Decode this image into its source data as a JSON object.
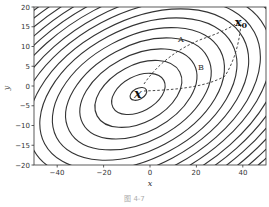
{
  "chart_data": {
    "type": "contour",
    "title": "",
    "xlabel": "x",
    "ylabel": "y",
    "xlim": [
      -50,
      50
    ],
    "ylim": [
      -20,
      20
    ],
    "xticks": [
      -40,
      -20,
      0,
      20,
      40
    ],
    "yticks": [
      -20,
      -15,
      -10,
      -5,
      0,
      5,
      10,
      15,
      20
    ],
    "grid": false,
    "minimum": {
      "label": "x",
      "x": -5,
      "y": -2
    },
    "start_point": {
      "label": "x0",
      "x": 37,
      "y": 18
    },
    "paths": [
      {
        "name": "A",
        "style": "dashed",
        "label_pos": {
          "x": 12,
          "y": 12
        }
      },
      {
        "name": "B",
        "style": "dashed",
        "label_pos": {
          "x": 22,
          "y": 4
        }
      }
    ],
    "contour_style": "elliptical level sets of a tilted quadratic, solid dark gray lines"
  },
  "axes": {
    "xlabel": "x",
    "ylabel": "y",
    "xtick_labels": [
      "−40",
      "−20",
      "0",
      "20",
      "40"
    ],
    "ytick_labels": [
      "−20",
      "−15",
      "−10",
      "−5",
      "0",
      "5",
      "10",
      "15",
      "20"
    ]
  },
  "annotations": {
    "minimum_label": "x",
    "start_label": "x",
    "start_subscript": "0",
    "path_a": "A",
    "path_b": "B"
  },
  "caption": "图 4-7"
}
